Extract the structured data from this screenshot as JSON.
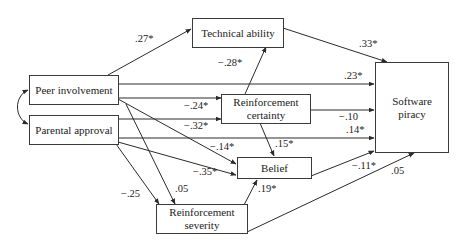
{
  "diagram": {
    "type": "path-model",
    "nodes": {
      "technical_ability": {
        "label": "Technical ability"
      },
      "peer_involvement": {
        "label": "Peer involvement"
      },
      "parental_approval": {
        "label": "Parental approval"
      },
      "reinforcement_certainty": {
        "label": "Reinforcement certainty"
      },
      "belief": {
        "label": "Belief"
      },
      "reinforcement_severity": {
        "label": "Reinforcement severity"
      },
      "software_piracy": {
        "label": "Software piracy"
      }
    },
    "edges": [
      {
        "id": "peer_tech",
        "from": "Peer involvement",
        "to": "Technical ability",
        "label": ".27*"
      },
      {
        "id": "tech_sp",
        "from": "Technical ability",
        "to": "Software piracy",
        "label": ".33*"
      },
      {
        "id": "rc_tech",
        "from": "Reinforcement certainty",
        "to": "Technical ability",
        "label": "−.28*"
      },
      {
        "id": "peer_sp",
        "from": "Peer involvement",
        "to": "Software piracy",
        "label": ".23*"
      },
      {
        "id": "peer_rc",
        "from": "Peer involvement",
        "to": "Reinforcement certainty",
        "label": "−.24*"
      },
      {
        "id": "rc_sp",
        "from": "Reinforcement certainty",
        "to": "Software piracy",
        "label": "−.10"
      },
      {
        "id": "par_rc",
        "from": "Parental approval",
        "to": "Reinforcement certainty",
        "label": "−.32*"
      },
      {
        "id": "par_sp",
        "from": "Parental approval",
        "to": "Software piracy",
        "label": ".14*"
      },
      {
        "id": "rc_belief",
        "from": "Reinforcement certainty",
        "to": "Belief",
        "label": ".15*"
      },
      {
        "id": "peer_belief",
        "from": "Peer involvement",
        "to": "Belief",
        "label": "−.14*"
      },
      {
        "id": "par_belief",
        "from": "Parental approval",
        "to": "Belief",
        "label": "−.35*"
      },
      {
        "id": "belief_sp",
        "from": "Belief",
        "to": "Software piracy",
        "label": "−.11*"
      },
      {
        "id": "peer_rs",
        "from": "Peer involvement",
        "to": "Reinforcement severity",
        "label": ".05"
      },
      {
        "id": "par_rs",
        "from": "Parental approval",
        "to": "Reinforcement severity",
        "label": "−.25"
      },
      {
        "id": "rs_belief",
        "from": "Reinforcement severity",
        "to": "Belief",
        "label": ".19*"
      },
      {
        "id": "rs_sp",
        "from": "Reinforcement severity",
        "to": "Software piracy",
        "label": ".05"
      },
      {
        "id": "peer_par_corr",
        "from": "Peer involvement",
        "to": "Parental approval",
        "label": "",
        "bidirectional": true
      }
    ]
  },
  "labels": {
    "peer_tech": ".27*",
    "tech_sp": ".33*",
    "rc_tech": "−.28*",
    "peer_sp": ".23*",
    "peer_rc": "−.24*",
    "rc_sp": "−.10",
    "par_rc": "−.32*",
    "par_sp": ".14*",
    "rc_belief": ".15*",
    "peer_belief": "−.14*",
    "par_belief": "−.35*",
    "belief_sp": "−.11*",
    "peer_rs": ".05",
    "par_rs": "−.25",
    "rs_belief": ".19*",
    "rs_sp": ".05"
  },
  "colors": {
    "line": "#2a2a2a",
    "text": "#222222",
    "background": "#ffffff"
  }
}
